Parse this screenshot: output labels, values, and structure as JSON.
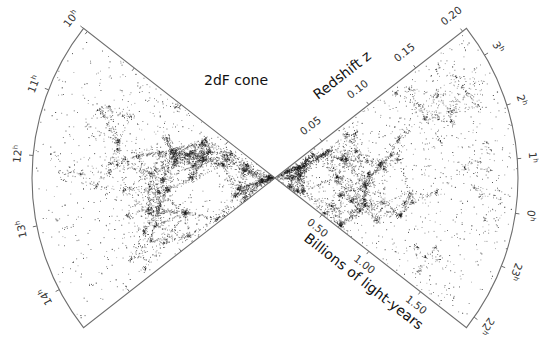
{
  "title": "2dF cone",
  "colors": {
    "background": "#ffffff",
    "outline": "#6e6e6e",
    "galaxy": "#1a1a1a",
    "text": "#222222"
  },
  "geometry": {
    "vertex": [
      275,
      178
    ],
    "radius": 243,
    "half_angle_deg": 38
  },
  "axes": {
    "redshift": {
      "title": "Redshift z",
      "ticks": [
        {
          "label": "0.05",
          "frac": 0.245
        },
        {
          "label": "0.10",
          "frac": 0.49
        },
        {
          "label": "0.15",
          "frac": 0.735
        },
        {
          "label": "0.20",
          "frac": 0.98
        }
      ]
    },
    "distance": {
      "title": "Billions of light-years",
      "ticks": [
        {
          "label": "0.50",
          "frac": 0.245
        },
        {
          "label": "1.00",
          "frac": 0.49
        },
        {
          "label": "1.50",
          "frac": 0.76
        }
      ]
    }
  },
  "left_fan": {
    "hours": [
      {
        "label": "10",
        "sup": "h",
        "t": 0.0
      },
      {
        "label": "11",
        "sup": "h",
        "t": 0.22
      },
      {
        "label": "12",
        "sup": "h",
        "t": 0.43
      },
      {
        "label": "13",
        "sup": "h",
        "t": 0.65
      },
      {
        "label": "14",
        "sup": "h",
        "t": 0.86
      }
    ]
  },
  "right_fan": {
    "hours": [
      {
        "label": "3",
        "sup": "h",
        "t": 0.1
      },
      {
        "label": "2",
        "sup": "h",
        "t": 0.27
      },
      {
        "label": "1",
        "sup": "h",
        "t": 0.44
      },
      {
        "label": "0",
        "sup": "h",
        "t": 0.61
      },
      {
        "label": "23",
        "sup": "h",
        "t": 0.78
      },
      {
        "label": "22",
        "sup": "h",
        "t": 0.96
      }
    ]
  }
}
